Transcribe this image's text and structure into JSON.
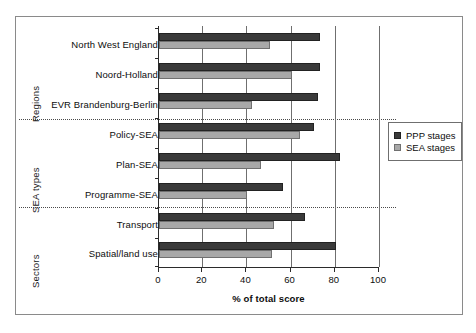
{
  "chart_data": {
    "type": "bar",
    "orientation": "horizontal",
    "title": "",
    "xlabel": "% of total score",
    "ylabel": "",
    "xlim": [
      0,
      100
    ],
    "xticks": [
      0,
      20,
      40,
      60,
      80,
      100
    ],
    "grid": "vertical",
    "legend_position": "right",
    "categories": [
      "North West England",
      "Noord-Holland",
      "EVR Brandenburg-Berlin",
      "Policy-SEA",
      "Plan-SEA",
      "Programme-SEA",
      "Transport",
      "Spatial/land use"
    ],
    "groups": [
      {
        "label": "Regions",
        "categories": [
          "North West England",
          "Noord-Holland",
          "EVR Brandenburg-Berlin"
        ]
      },
      {
        "label": "SEA types",
        "categories": [
          "Policy-SEA",
          "Plan-SEA",
          "Programme-SEA"
        ]
      },
      {
        "label": "Sectors",
        "categories": [
          "Transport",
          "Spatial/land use"
        ]
      }
    ],
    "series": [
      {
        "name": "PPP stages",
        "color": "#3a3a3a",
        "values": [
          73,
          73,
          72,
          70,
          82,
          56,
          66,
          80
        ]
      },
      {
        "name": "SEA stages",
        "color": "#a8a8a8",
        "values": [
          50,
          60,
          42,
          64,
          46,
          40,
          52,
          51
        ]
      }
    ]
  },
  "legend": {
    "items": [
      {
        "label": "PPP stages"
      },
      {
        "label": "SEA stages"
      }
    ]
  }
}
